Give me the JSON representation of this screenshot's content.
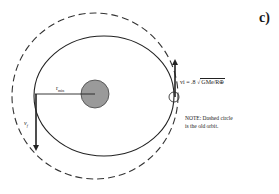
{
  "figure": {
    "part_label": "c)",
    "labels": {
      "r_min": "r",
      "r_min_sub": "min",
      "v_f": "v",
      "v_f_sub": "f",
      "v_i_prefix": "vi = .8",
      "v_i_radical": "GMe/R⊕",
      "note_line1": "NOTE:  Dashed circle",
      "note_line2": "is the old orbit."
    },
    "elements": {
      "old_orbit": "dashed circle",
      "new_orbit": "solid ellipse",
      "planet": "Earth (gray filled circle)",
      "satellite": "small circle at orbit contact point"
    },
    "colors": {
      "line": "#222222",
      "planet_fill": "#9a9a9a",
      "background": "#ffffff"
    }
  }
}
